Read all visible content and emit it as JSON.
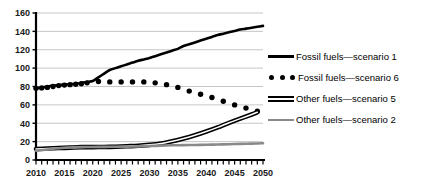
{
  "chart_data": {
    "type": "line",
    "title": "",
    "subtitle": "",
    "xlabel": "",
    "ylabel": "",
    "xlim": [
      2010,
      2050
    ],
    "ylim": [
      0,
      160
    ],
    "ytick_step": 20,
    "xtick_major_step": 5,
    "xtick_minor_step": 1,
    "grid": "horizontal",
    "legend_position": "right",
    "yticks": [
      "160",
      "140",
      "120",
      "100",
      "80",
      "60",
      "40",
      "20",
      "0"
    ],
    "xticks": [
      "2010",
      "2015",
      "2020",
      "2025",
      "2030",
      "2035",
      "2040",
      "2045",
      "2050"
    ],
    "series": [
      {
        "name": "Fossil fuels — scenario 1",
        "style": "solid-thick",
        "color": "#000000",
        "x": [
          2010,
          2011,
          2012,
          2013,
          2014,
          2015,
          2016,
          2017,
          2018,
          2019,
          2020,
          2021,
          2022,
          2023,
          2024,
          2025,
          2026,
          2027,
          2028,
          2029,
          2030,
          2031,
          2032,
          2033,
          2034,
          2035,
          2036,
          2037,
          2038,
          2039,
          2040,
          2041,
          2042,
          2043,
          2044,
          2045,
          2046,
          2047,
          2048,
          2049,
          2050
        ],
        "values": [
          78,
          79,
          80,
          81,
          81.5,
          82,
          82.5,
          83,
          84,
          85,
          86,
          90,
          94,
          98,
          100,
          102,
          104,
          106,
          108,
          109.5,
          111,
          113,
          115,
          117,
          119,
          121,
          124,
          126,
          128,
          130,
          132,
          134,
          136,
          137.5,
          139,
          140.5,
          142,
          143,
          144,
          145,
          146
        ]
      },
      {
        "name": "Fossil fuels — scenario 6",
        "style": "dotted",
        "color": "#000000",
        "x": [
          2010,
          2011,
          2012,
          2013,
          2014,
          2015,
          2016,
          2017,
          2018,
          2019,
          2021,
          2023,
          2025,
          2027,
          2029,
          2031,
          2033,
          2035,
          2037,
          2039,
          2041,
          2043,
          2045,
          2047,
          2049
        ],
        "values": [
          78,
          78.5,
          79,
          80,
          81,
          81.5,
          82,
          82.5,
          83,
          84,
          85.5,
          85,
          85,
          85,
          85,
          84,
          82,
          79,
          75,
          71.5,
          68,
          64,
          60,
          56.5,
          53
        ]
      },
      {
        "name": "Other fuels — scenario 5",
        "style": "double",
        "color": "#000000",
        "x": [
          2010,
          2012,
          2014,
          2016,
          2018,
          2020,
          2022,
          2024,
          2026,
          2028,
          2030,
          2032,
          2034,
          2036,
          2038,
          2040,
          2042,
          2044,
          2046,
          2048,
          2049
        ],
        "values": [
          12,
          12.5,
          13,
          13.5,
          14,
          14,
          14.2,
          14.5,
          15,
          15.5,
          16.5,
          18,
          20.5,
          23.5,
          27,
          31,
          35.5,
          40.5,
          45,
          49.5,
          52
        ]
      },
      {
        "name": "Other fuels — scenario 2",
        "style": "solid-gray",
        "color": "#8a8a8a",
        "x": [
          2010,
          2012,
          2014,
          2016,
          2018,
          2020,
          2022,
          2024,
          2026,
          2028,
          2030,
          2032,
          2034,
          2036,
          2038,
          2040,
          2042,
          2044,
          2046,
          2048,
          2050
        ],
        "values": [
          10,
          11.5,
          12.8,
          13.6,
          14,
          14.2,
          14.3,
          14.4,
          14.5,
          14.8,
          15.2,
          15.6,
          16,
          16.2,
          16.4,
          16.6,
          16.9,
          17.2,
          17.5,
          17.8,
          18.2
        ]
      }
    ]
  },
  "legend": {
    "items": [
      {
        "label": "Fossil fuels—scenario 1",
        "swatch": "solid-line-swatch"
      },
      {
        "label": "Fossil fuels—scenario 6",
        "swatch": "dotted-line-swatch"
      },
      {
        "label": "Other fuels—scenario 5",
        "swatch": "double-line-swatch"
      },
      {
        "label": "Other fuels—scenario 2",
        "swatch": "gray-line-swatch"
      }
    ]
  },
  "axes": {
    "y_labels": [
      "160",
      "140",
      "120",
      "100",
      "80",
      "60",
      "40",
      "20",
      "0"
    ],
    "x_labels": [
      "2010",
      "2015",
      "2020",
      "2025",
      "2030",
      "2035",
      "2040",
      "2045",
      "2050"
    ]
  }
}
